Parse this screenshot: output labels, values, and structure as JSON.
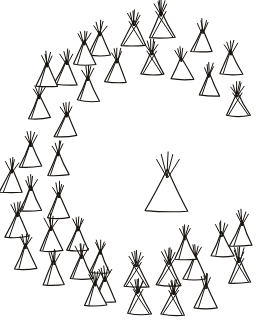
{
  "image": {
    "title": "Tipi Camp Circle",
    "subject": "tipi-camp-circle-diagram",
    "medium": "ink line drawing",
    "background_color": "#ffffff",
    "ink_color": "#18140f",
    "width": 263,
    "height": 329,
    "tipi_count": 41,
    "ring_tipi_count": 40,
    "center_tipi_count": 1
  },
  "scene": {
    "center_tipi": {
      "label": "center-tipi",
      "x": 167,
      "y": 190,
      "width": 43,
      "height": 42,
      "style": "plain",
      "pole_count": 5
    },
    "ring_tipis": [
      {
        "label": "ring-tipi-01",
        "x": 162,
        "y": 24,
        "width": 26,
        "height": 27,
        "style": "crossed",
        "pole_count": 6
      },
      {
        "label": "ring-tipi-02",
        "x": 133,
        "y": 33,
        "width": 24,
        "height": 25,
        "style": "crossed",
        "pole_count": 6
      },
      {
        "label": "ring-tipi-03",
        "x": 202,
        "y": 40,
        "width": 22,
        "height": 23,
        "style": "seamed",
        "pole_count": 5
      },
      {
        "label": "ring-tipi-04",
        "x": 100,
        "y": 43,
        "width": 22,
        "height": 24,
        "style": "seamed",
        "pole_count": 5
      },
      {
        "label": "ring-tipi-05",
        "x": 152,
        "y": 62,
        "width": 24,
        "height": 24,
        "style": "crossed",
        "pole_count": 6
      },
      {
        "label": "ring-tipi-06",
        "x": 231,
        "y": 62,
        "width": 23,
        "height": 24,
        "style": "seamed",
        "pole_count": 5
      },
      {
        "label": "ring-tipi-07",
        "x": 182,
        "y": 68,
        "width": 22,
        "height": 22,
        "style": "plain",
        "pole_count": 5
      },
      {
        "label": "ring-tipi-08",
        "x": 116,
        "y": 70,
        "width": 22,
        "height": 24,
        "style": "seamed",
        "pole_count": 5
      },
      {
        "label": "ring-tipi-09",
        "x": 66,
        "y": 72,
        "width": 23,
        "height": 25,
        "style": "seamed",
        "pole_count": 5
      },
      {
        "label": "ring-tipi-10",
        "x": 209,
        "y": 84,
        "width": 21,
        "height": 23,
        "style": "seamed",
        "pole_count": 5
      },
      {
        "label": "ring-tipi-11",
        "x": 88,
        "y": 88,
        "width": 22,
        "height": 25,
        "style": "seamed",
        "pole_count": 5
      },
      {
        "label": "ring-tipi-12",
        "x": 238,
        "y": 104,
        "width": 23,
        "height": 24,
        "style": "crossed",
        "pole_count": 6
      },
      {
        "label": "ring-tipi-13",
        "x": 40,
        "y": 106,
        "width": 22,
        "height": 24,
        "style": "seamed",
        "pole_count": 5
      },
      {
        "label": "ring-tipi-14",
        "x": 66,
        "y": 124,
        "width": 22,
        "height": 24,
        "style": "seamed",
        "pole_count": 5
      },
      {
        "label": "ring-tipi-15",
        "x": 30,
        "y": 154,
        "width": 23,
        "height": 25,
        "style": "seamed",
        "pole_count": 5
      },
      {
        "label": "ring-tipi-16",
        "x": 58,
        "y": 163,
        "width": 21,
        "height": 24,
        "style": "seamed",
        "pole_count": 5
      },
      {
        "label": "ring-tipi-17",
        "x": 31,
        "y": 198,
        "width": 23,
        "height": 25,
        "style": "seamed",
        "pole_count": 5
      },
      {
        "label": "ring-tipi-18",
        "x": 59,
        "y": 205,
        "width": 22,
        "height": 25,
        "style": "seamed",
        "pole_count": 5
      },
      {
        "label": "ring-tipi-19",
        "x": 52,
        "y": 238,
        "width": 22,
        "height": 25,
        "style": "seamed",
        "pole_count": 5
      },
      {
        "label": "ring-tipi-20",
        "x": 77,
        "y": 238,
        "width": 22,
        "height": 24,
        "style": "seamed",
        "pole_count": 5
      },
      {
        "label": "ring-tipi-21",
        "x": 81,
        "y": 266,
        "width": 22,
        "height": 25,
        "style": "seamed",
        "pole_count": 5
      },
      {
        "label": "ring-tipi-22",
        "x": 100,
        "y": 261,
        "width": 21,
        "height": 23,
        "style": "seamed",
        "pole_count": 5
      },
      {
        "label": "ring-tipi-23",
        "x": 105,
        "y": 289,
        "width": 22,
        "height": 25,
        "style": "seamed",
        "pole_count": 5
      },
      {
        "label": "ring-tipi-24",
        "x": 137,
        "y": 274,
        "width": 24,
        "height": 25,
        "style": "crossed",
        "pole_count": 6
      },
      {
        "label": "ring-tipi-25",
        "x": 139,
        "y": 301,
        "width": 24,
        "height": 25,
        "style": "crossed",
        "pole_count": 6
      },
      {
        "label": "ring-tipi-26",
        "x": 168,
        "y": 272,
        "width": 24,
        "height": 26,
        "style": "crossed",
        "pole_count": 6
      },
      {
        "label": "ring-tipi-27",
        "x": 173,
        "y": 302,
        "width": 24,
        "height": 25,
        "style": "crossed",
        "pole_count": 6
      },
      {
        "label": "ring-tipi-28",
        "x": 195,
        "y": 267,
        "width": 23,
        "height": 25,
        "style": "seamed",
        "pole_count": 5
      },
      {
        "label": "ring-tipi-29",
        "x": 206,
        "y": 296,
        "width": 22,
        "height": 25,
        "style": "seamed",
        "pole_count": 5
      },
      {
        "label": "ring-tipi-30",
        "x": 222,
        "y": 244,
        "width": 23,
        "height": 25,
        "style": "seamed",
        "pole_count": 5
      },
      {
        "label": "ring-tipi-31",
        "x": 240,
        "y": 270,
        "width": 23,
        "height": 25,
        "style": "crossed",
        "pole_count": 6
      },
      {
        "label": "ring-tipi-32",
        "x": 241,
        "y": 233,
        "width": 23,
        "height": 25,
        "style": "seamed",
        "pole_count": 5
      },
      {
        "label": "ring-tipi-33",
        "x": 17,
        "y": 224,
        "width": 23,
        "height": 25,
        "style": "seamed",
        "pole_count": 5
      },
      {
        "label": "ring-tipi-34",
        "x": 25,
        "y": 256,
        "width": 23,
        "height": 25,
        "style": "seamed",
        "pole_count": 5
      },
      {
        "label": "ring-tipi-35",
        "x": 95,
        "y": 293,
        "width": 22,
        "height": 24,
        "style": "seamed",
        "pole_count": 5
      },
      {
        "label": "ring-tipi-36",
        "x": 54,
        "y": 272,
        "width": 22,
        "height": 25,
        "style": "seamed",
        "pole_count": 5
      },
      {
        "label": "ring-tipi-37",
        "x": 186,
        "y": 247,
        "width": 22,
        "height": 24,
        "style": "seamed",
        "pole_count": 5
      },
      {
        "label": "ring-tipi-38",
        "x": 11,
        "y": 180,
        "width": 22,
        "height": 24,
        "style": "seamed",
        "pole_count": 5
      },
      {
        "label": "ring-tipi-39",
        "x": 46,
        "y": 74,
        "width": 22,
        "height": 24,
        "style": "seamed",
        "pole_count": 5
      },
      {
        "label": "ring-tipi-40",
        "x": 84,
        "y": 52,
        "width": 22,
        "height": 24,
        "style": "seamed",
        "pole_count": 5
      }
    ]
  }
}
